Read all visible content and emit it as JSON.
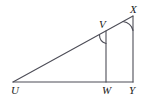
{
  "figure": {
    "name": "triangle-with-parallel-segments",
    "stroke_color": "#4d4d57",
    "label_color": "#1a1a1a",
    "background_color": "#ffffff",
    "stroke_width": 1,
    "vertices": [
      {
        "id": "U",
        "label": "U",
        "x": 13,
        "y": 82,
        "label_x": 11,
        "label_y": 94
      },
      {
        "id": "V",
        "label": "V",
        "x": 106,
        "y": 31,
        "label_x": 99,
        "label_y": 28
      },
      {
        "id": "W",
        "label": "W",
        "x": 106,
        "y": 82,
        "label_x": 102,
        "label_y": 94
      },
      {
        "id": "X",
        "label": "X",
        "x": 133,
        "y": 16,
        "label_x": 129,
        "label_y": 13
      },
      {
        "id": "Y",
        "label": "Y",
        "x": 133,
        "y": 82,
        "label_x": 129,
        "label_y": 94
      }
    ],
    "segments": [
      {
        "id": "UX",
        "from": "U",
        "to": "X",
        "x1": 13,
        "y1": 82,
        "x2": 133,
        "y2": 16
      },
      {
        "id": "UY",
        "from": "U",
        "to": "Y",
        "x1": 13,
        "y1": 82,
        "x2": 133,
        "y2": 82
      },
      {
        "id": "VW",
        "from": "V",
        "to": "W",
        "x1": 106,
        "y1": 31,
        "x2": 106,
        "y2": 82
      },
      {
        "id": "XY",
        "from": "X",
        "to": "Y",
        "x1": 133,
        "y1": 16,
        "x2": 133,
        "y2": 82
      }
    ],
    "angle_marks": [
      {
        "id": "angle-V",
        "at": "V",
        "path": "M 99.5 34.8 A 9 9 0 0 0 106 43.5"
      },
      {
        "id": "angle-X",
        "at": "X",
        "path": "M 122.9 21.5 A 12 12 0 0 1 133 30.5"
      }
    ]
  }
}
